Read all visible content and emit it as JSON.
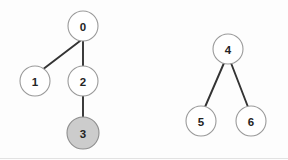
{
  "diagram": {
    "background_color": "#fdfdfd",
    "edge_color": "#333333",
    "node_stroke_color": "#9a9a9a",
    "node_fill_default": "#ffffff",
    "node_fill_highlight": "#cccccc",
    "node_radius": 15,
    "highlight_radius": 16,
    "nodes": [
      {
        "id": "0",
        "label": "0",
        "cx": 83,
        "cy": 26,
        "r": 15,
        "state": "default"
      },
      {
        "id": "1",
        "label": "1",
        "cx": 35,
        "cy": 81,
        "r": 15,
        "state": "default"
      },
      {
        "id": "2",
        "label": "2",
        "cx": 83,
        "cy": 81,
        "r": 15,
        "state": "default"
      },
      {
        "id": "3",
        "label": "3",
        "cx": 83,
        "cy": 133,
        "r": 16,
        "state": "highlighted"
      },
      {
        "id": "4",
        "label": "4",
        "cx": 228,
        "cy": 49,
        "r": 15,
        "state": "default"
      },
      {
        "id": "5",
        "label": "5",
        "cx": 201,
        "cy": 121,
        "r": 15,
        "state": "default"
      },
      {
        "id": "6",
        "label": "6",
        "cx": 251,
        "cy": 121,
        "r": 15,
        "state": "default"
      }
    ],
    "edges": [
      {
        "from": "0",
        "to": "1",
        "x1": 80,
        "y1": 41,
        "x2": 42,
        "y2": 70
      },
      {
        "from": "0",
        "to": "2",
        "x1": 83,
        "y1": 41,
        "x2": 83,
        "y2": 66
      },
      {
        "from": "2",
        "to": "3",
        "x1": 83,
        "y1": 96,
        "x2": 83,
        "y2": 117
      },
      {
        "from": "4",
        "to": "5",
        "x1": 224,
        "y1": 63,
        "x2": 205,
        "y2": 107
      },
      {
        "from": "4",
        "to": "6",
        "x1": 231,
        "y1": 63,
        "x2": 248,
        "y2": 107
      }
    ],
    "components": [
      {
        "name": "left-tree",
        "root": "0",
        "members": [
          "0",
          "1",
          "2",
          "3"
        ]
      },
      {
        "name": "right-tree",
        "root": "4",
        "members": [
          "4",
          "5",
          "6"
        ]
      }
    ]
  },
  "chart_data": {
    "type": "diagram",
    "subtype": "graph-forest",
    "node_labels": [
      "0",
      "1",
      "2",
      "3",
      "4",
      "5",
      "6"
    ],
    "edge_list": [
      [
        "0",
        "1"
      ],
      [
        "0",
        "2"
      ],
      [
        "2",
        "3"
      ],
      [
        "4",
        "5"
      ],
      [
        "4",
        "6"
      ]
    ],
    "highlighted_nodes": [
      "3"
    ],
    "component_count": 2
  }
}
